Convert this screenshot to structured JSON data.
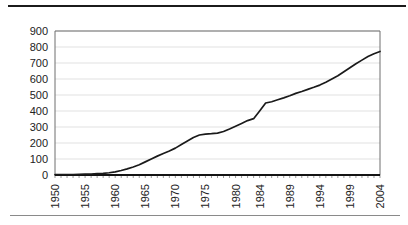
{
  "page": {
    "top_rule": "horizontal-rule",
    "bottom_rule": "horizontal-rule"
  },
  "chart_data": {
    "type": "line",
    "title": "",
    "subtitle": "",
    "xlabel": "",
    "ylabel": "",
    "ylim": [
      0,
      900
    ],
    "ytick_step": 100,
    "yticks": [
      0,
      100,
      200,
      300,
      400,
      500,
      600,
      700,
      800,
      900
    ],
    "ytick_labels": [
      "0",
      "100",
      "200",
      "300",
      "400",
      "500",
      "600",
      "700",
      "800",
      "900"
    ],
    "grid": true,
    "grid_axis": "y",
    "legend": false,
    "legend_position": "none",
    "line_color": "#1a1a1a",
    "grid_color": "#d9d9d9",
    "axis_color": "#6f6f6f",
    "x_axis_type": "category",
    "x_tick_rotation": 90,
    "xtick_labels": [
      "1950",
      "1955",
      "1960",
      "1965",
      "1970",
      "1975",
      "1980",
      "1984",
      "1989",
      "1994",
      "1999",
      "2004"
    ],
    "xtick_categories": [
      "1950",
      "1955",
      "1960",
      "1965",
      "1970",
      "1975",
      "1980",
      "1984",
      "1989",
      "1994",
      "1999",
      "2004"
    ],
    "categories": [
      "1950",
      "1951",
      "1952",
      "1953",
      "1954",
      "1955",
      "1956",
      "1957",
      "1958",
      "1959",
      "1960",
      "1961",
      "1962",
      "1963",
      "1964",
      "1965",
      "1966",
      "1967",
      "1968",
      "1969",
      "1970",
      "1971",
      "1972",
      "1973",
      "1974",
      "1975",
      "1976",
      "1977",
      "1978",
      "1979",
      "1980",
      "1981",
      "1982",
      "1983",
      "1984",
      "1985",
      "1986",
      "1987",
      "1988",
      "1989",
      "1990",
      "1991",
      "1992",
      "1993",
      "1994",
      "1995",
      "1996",
      "1997",
      "1998",
      "1999",
      "2000",
      "2001",
      "2002",
      "2003",
      "2004"
    ],
    "values": [
      2,
      2,
      3,
      3,
      4,
      5,
      6,
      8,
      10,
      14,
      20,
      28,
      38,
      50,
      64,
      82,
      100,
      118,
      134,
      150,
      168,
      190,
      212,
      234,
      250,
      256,
      258,
      262,
      272,
      288,
      305,
      322,
      340,
      352,
      400,
      450,
      458,
      470,
      482,
      495,
      510,
      522,
      535,
      548,
      562,
      580,
      600,
      620,
      645,
      670,
      695,
      718,
      740,
      758,
      772
    ],
    "value_range": [
      2,
      772
    ],
    "first_value": 2,
    "last_value": 772
  }
}
